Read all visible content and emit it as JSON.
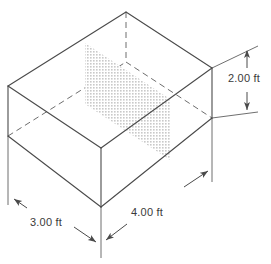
{
  "figure": {
    "type": "engineering-diagram",
    "background_color": "#ffffff",
    "line_color": "#4a4a4a",
    "hidden_line_color": "#6e6e6e",
    "plane_fill_color": "#d9d9d9",
    "plane_pattern": "stipple-dot-hatch",
    "text_color": "#3a3a3a"
  },
  "dimensions": {
    "height": {
      "value": "2.00",
      "unit": "ft",
      "label": "2.00 ft",
      "orientation": "vertical",
      "position": "right",
      "arrowheads": "both"
    },
    "depth": {
      "value": "3.00",
      "unit": "ft",
      "label": "3.00 ft",
      "orientation": "diagonal-up-left",
      "position": "bottom-left",
      "arrowheads": "both"
    },
    "width": {
      "value": "4.00",
      "unit": "ft",
      "label": "4.00 ft",
      "orientation": "diagonal-up-right",
      "position": "bottom-right",
      "arrowheads": "both"
    }
  },
  "geometry": {
    "box": {
      "top_face": {
        "left": [
          8,
          86
        ],
        "back": [
          126,
          12
        ],
        "right": [
          212,
          68
        ],
        "front": [
          101,
          148
        ]
      },
      "bottom_face": {
        "left": [
          8,
          136
        ],
        "back": [
          126,
          62
        ],
        "right": [
          212,
          118
        ],
        "front": [
          101,
          207
        ]
      },
      "visible_edges": [
        "top-left-back",
        "top-back-right",
        "top-right-front",
        "top-front-left",
        "vert-left",
        "vert-right",
        "vert-front",
        "bottom-left-front",
        "bottom-front-right"
      ],
      "hidden_edges": [
        "vert-back",
        "bottom-left-back",
        "bottom-back-right"
      ]
    },
    "cross_section_plane": {
      "corners": [
        [
          85,
          43
        ],
        [
          170,
          99
        ],
        [
          170,
          160
        ],
        [
          85,
          104
        ]
      ],
      "description": "vertical shaded rectangle slicing through box interior"
    }
  }
}
